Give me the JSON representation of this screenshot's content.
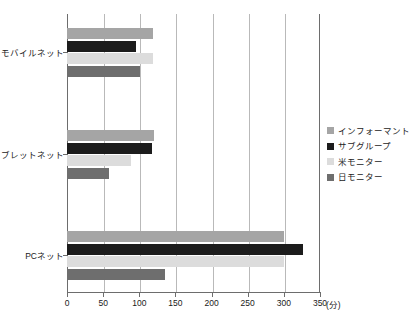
{
  "chart_data": {
    "type": "bar",
    "orientation": "horizontal",
    "title": "",
    "xlabel": "(分)",
    "ylabel": "",
    "xlim": [
      0,
      350
    ],
    "xticks": [
      "0",
      "50",
      "100",
      "150",
      "200",
      "250",
      "300",
      "350"
    ],
    "xtick_values": [
      0,
      50,
      100,
      150,
      200,
      250,
      300,
      350
    ],
    "unit": "(分)",
    "grid": true,
    "legend_position": "right",
    "categories": [
      "モバイルネット",
      "タブレットネット",
      "PCネット"
    ],
    "series": [
      {
        "name": "インフォーマント",
        "color": "#a5a5a5",
        "values": [
          119,
          120,
          300
        ]
      },
      {
        "name": "サブグループ",
        "color": "#1c1c1c",
        "values": [
          95,
          118,
          326
        ]
      },
      {
        "name": "米モニター",
        "color": "#dcdcdc",
        "values": [
          119,
          89,
          300
        ]
      },
      {
        "name": "日モニター",
        "color": "#6e6e6e",
        "values": [
          101,
          58,
          135
        ]
      }
    ]
  },
  "caption": {
    "text": ""
  }
}
